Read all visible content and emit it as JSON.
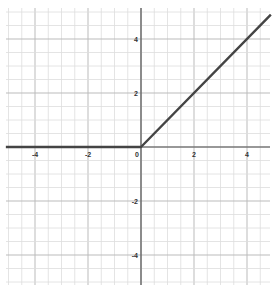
{
  "chart_data": {
    "type": "line",
    "title": "",
    "xlabel": "",
    "ylabel": "",
    "xlim": [
      -5.1,
      4.9
    ],
    "ylim": [
      -5.1,
      5.1
    ],
    "grid": true,
    "grid_major_step": 1,
    "grid_minor_step": 0.5,
    "x_ticks": [
      -4,
      -2,
      0,
      2,
      4
    ],
    "y_ticks": [
      -4,
      -2,
      2,
      4
    ],
    "x_tick_labels": [
      "-4",
      "-2",
      "0",
      "2",
      "4"
    ],
    "y_tick_labels": [
      "-4",
      "-2",
      "2",
      "4"
    ],
    "series": [
      {
        "name": "ReLU",
        "function": "y = max(0, x)",
        "x": [
          -5.1,
          0,
          4.9
        ],
        "values": [
          0,
          0,
          4.9
        ],
        "color": "#444444"
      }
    ],
    "legend": null
  },
  "colors": {
    "grid_minor": "#dddddd",
    "grid_major": "#bbbbbb",
    "axis": "#555555",
    "line": "#444444"
  },
  "caption": ""
}
